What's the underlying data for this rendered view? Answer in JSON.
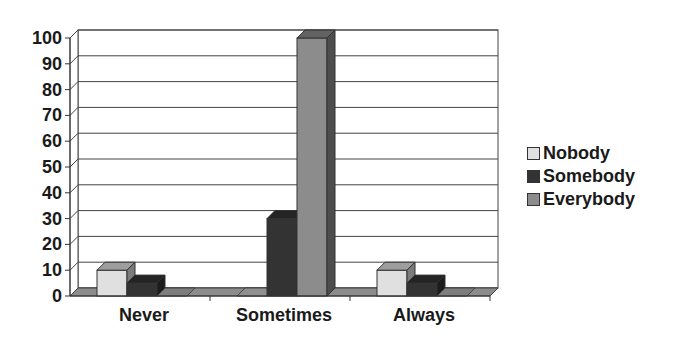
{
  "chart_data": {
    "type": "bar",
    "style": "3d-clustered-column",
    "title": "",
    "xlabel": "",
    "ylabel": "",
    "categories": [
      "Never",
      "Sometimes",
      "Always"
    ],
    "series": [
      {
        "name": "Nobody",
        "color": "#e0e0e0",
        "values": [
          10,
          0,
          10
        ]
      },
      {
        "name": "Somebody",
        "color": "#333333",
        "values": [
          5,
          30,
          5
        ]
      },
      {
        "name": "Everybody",
        "color": "#8c8c8c",
        "values": [
          0,
          100,
          0
        ]
      }
    ],
    "ylim": [
      0,
      100
    ],
    "yticks": [
      "0",
      "10",
      "20",
      "30",
      "40",
      "50",
      "60",
      "70",
      "80",
      "90",
      "100"
    ],
    "grid": true,
    "legend_position": "right"
  },
  "legend": {
    "items": [
      {
        "label": "Nobody",
        "color": "#e0e0e0"
      },
      {
        "label": "Somebody",
        "color": "#333333"
      },
      {
        "label": "Everybody",
        "color": "#8c8c8c"
      }
    ]
  }
}
